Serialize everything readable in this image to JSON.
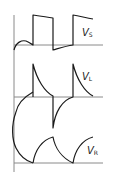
{
  "diagram": {
    "labels": {
      "vs": {
        "main": "V",
        "sub": "S"
      },
      "vl": {
        "main": "V",
        "sub": "L"
      },
      "vr": {
        "main": "V",
        "sub": "R"
      }
    },
    "colors": {
      "axis": "#8a8a8a",
      "wave": "#1a1a1a",
      "background": "#ffffff"
    },
    "traces": [
      {
        "name": "source-voltage",
        "label": "V_S",
        "shape": "square pulse train with slight droop"
      },
      {
        "name": "inductor-voltage",
        "label": "V_L",
        "shape": "exponential spikes, positive at rising edge, negative at falling edge"
      },
      {
        "name": "resistor-voltage",
        "label": "V_R",
        "shape": "exponential charge/discharge curves"
      }
    ]
  }
}
